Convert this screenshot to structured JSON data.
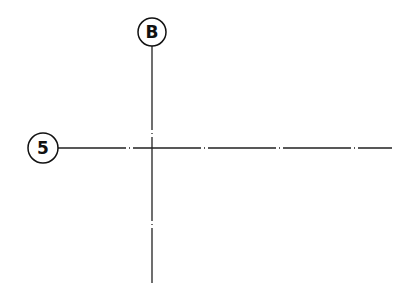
{
  "diagram": {
    "type": "architectural-grid",
    "background": "#ffffff",
    "line_color": "#222222",
    "grid_lines": [
      {
        "id": "B",
        "orientation": "vertical",
        "label": "B",
        "bubble": {
          "cx": 152,
          "cy": 32,
          "r": 14
        },
        "line": {
          "x1": 152,
          "y1": 46,
          "x2": 152,
          "y2": 283
        }
      },
      {
        "id": "5",
        "orientation": "horizontal",
        "label": "5",
        "bubble": {
          "cx": 43,
          "cy": 148,
          "r": 15
        },
        "line": {
          "x1": 58,
          "y1": 148,
          "x2": 392,
          "y2": 148
        }
      }
    ],
    "line_style": "dash-dot center line"
  }
}
